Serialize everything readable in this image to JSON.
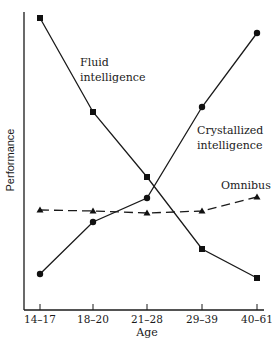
{
  "chart_data": {
    "type": "line",
    "title": "",
    "xlabel": "Age",
    "ylabel": "Performance",
    "categories": [
      "14–17",
      "18–20",
      "21–28",
      "29–39",
      "40–61"
    ],
    "yticks": "none",
    "grid": false,
    "legend": "inline labels",
    "series": [
      {
        "name": "Fluid intelligence",
        "marker": "square",
        "line": "solid",
        "values": [
          95,
          65,
          44,
          20,
          10
        ],
        "label_lines": [
          "Fluid",
          "intelligence"
        ]
      },
      {
        "name": "Crystallized intelligence",
        "marker": "circle",
        "line": "solid",
        "values": [
          12,
          29,
          37,
          67,
          95
        ],
        "label_lines": [
          "Crystallized",
          "intelligence"
        ]
      },
      {
        "name": "Omnibus",
        "marker": "triangle",
        "line": "dashed",
        "values": [
          33,
          32,
          31,
          32,
          38
        ],
        "label_lines": [
          "Omnibus"
        ]
      }
    ],
    "ylim": [
      0,
      100
    ],
    "annotations": []
  }
}
